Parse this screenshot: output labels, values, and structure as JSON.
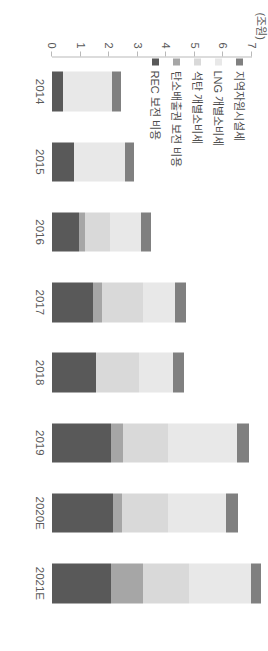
{
  "chart_data": {
    "type": "bar",
    "orientation": "vertical",
    "stacked": true,
    "title": "",
    "subtitle": "",
    "xlabel": "",
    "ylabel": "",
    "unit_label": "(조원)",
    "ylim": [
      0,
      7
    ],
    "yticks": [
      0,
      1,
      2,
      3,
      4,
      5,
      6,
      7
    ],
    "ytick_labels": [
      "0",
      "1",
      "2",
      "3",
      "4",
      "5",
      "6",
      "7"
    ],
    "grid": false,
    "legend_position": "top-left",
    "categories": [
      "2014",
      "2015",
      "2016",
      "2017",
      "2018",
      "2019",
      "2020E",
      "2021E"
    ],
    "series": [
      {
        "name": "REC 보전 비용",
        "color": "#595959",
        "values": [
          0.38,
          0.78,
          0.95,
          1.45,
          1.55,
          2.05,
          2.15,
          2.08
        ]
      },
      {
        "name": "탄소배출권 보전 비용",
        "color": "#a6a6a6",
        "values": [
          0.0,
          0.0,
          0.22,
          0.3,
          0.0,
          0.42,
          0.3,
          1.1
        ]
      },
      {
        "name": "석탄 개별소비세",
        "color": "#d9d9d9",
        "values": [
          0.0,
          0.0,
          0.85,
          1.45,
          1.5,
          1.6,
          1.6,
          1.6
        ]
      },
      {
        "name": "LNG 개별소비세",
        "color": "#e8e8e8",
        "values": [
          1.72,
          1.78,
          1.1,
          1.1,
          1.2,
          2.4,
          2.05,
          2.2
        ]
      },
      {
        "name": "지역자원시설세",
        "color": "#808080",
        "values": [
          0.3,
          0.32,
          0.35,
          0.38,
          0.38,
          0.42,
          0.4,
          0.32
        ]
      }
    ],
    "totals": [
      2.4,
      2.88,
      3.47,
      4.68,
      4.63,
      6.89,
      6.5,
      7.3
    ]
  },
  "legend": {
    "items": [
      {
        "label": "지역자원시설세",
        "color": "#808080"
      },
      {
        "label": "LNG 개별소비세",
        "color": "#e8e8e8"
      },
      {
        "label": "석탄 개별소비세",
        "color": "#d9d9d9"
      },
      {
        "label": "탄소배출권 보전 비용",
        "color": "#a6a6a6"
      },
      {
        "label": "REC 보전 비용",
        "color": "#595959"
      }
    ]
  }
}
